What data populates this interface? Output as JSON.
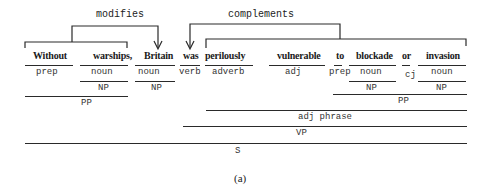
{
  "diagram": {
    "relations": [
      {
        "label": "modifies",
        "from": "Without warships",
        "to": "Britain"
      },
      {
        "label": "complements",
        "from": "perilously vulnerable to blockade or invasion",
        "to": "was"
      }
    ],
    "words": [
      {
        "text": "Without",
        "pos": "prep"
      },
      {
        "text": "warships,",
        "pos": "noun"
      },
      {
        "text": "Britain",
        "pos": "noun"
      },
      {
        "text": "was",
        "pos": "verb"
      },
      {
        "text": "perilously",
        "pos": "adverb"
      },
      {
        "text": "vulnerable",
        "pos": "adj"
      },
      {
        "text": "to",
        "pos": "prep"
      },
      {
        "text": "blockade",
        "pos": "noun"
      },
      {
        "text": "or",
        "pos": "cj"
      },
      {
        "text": "invasion",
        "pos": "noun"
      }
    ],
    "phrases": {
      "np_warships": "NP",
      "np_britain": "NP",
      "np_blockade": "NP",
      "np_invasion": "NP",
      "pp_without": "PP",
      "pp_to": "PP",
      "adj_phrase": "adj phrase",
      "vp": "VP",
      "s": "S"
    },
    "caption": "(a)"
  }
}
